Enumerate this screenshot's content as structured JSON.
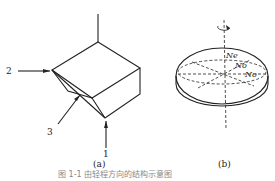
{
  "figure_a": {
    "label": "(a)",
    "arrows": [
      {
        "label": "1"
      },
      {
        "label": "2"
      },
      {
        "label": "3"
      }
    ]
  },
  "figure_b": {
    "label": "(b)",
    "axes": [
      {
        "label": "Ne"
      },
      {
        "label": "No"
      },
      {
        "label": "No"
      }
    ]
  },
  "caption": "图 1-1 由轻程方向的结构示意图",
  "colors": {
    "line": "#222222",
    "caption": "#888888"
  }
}
